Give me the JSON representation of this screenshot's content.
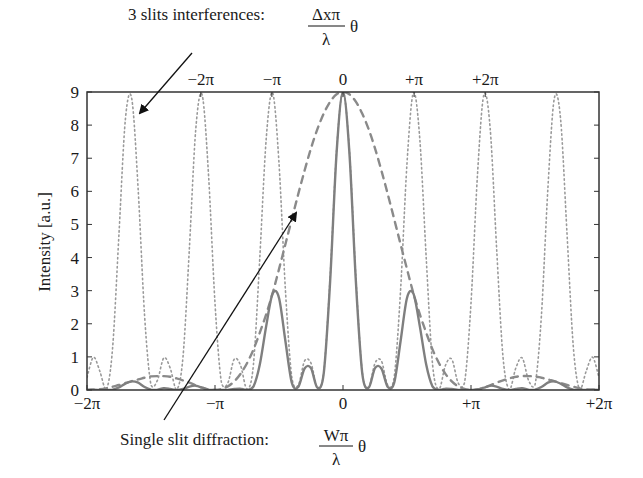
{
  "chart_data": {
    "type": "line",
    "title": "",
    "xlabel": "",
    "ylabel": "Intensity [a.u.]",
    "ylim": [
      0,
      9
    ],
    "xlim_pi": [
      -2,
      2
    ],
    "grid": false,
    "legend": "none",
    "y_ticks": [
      "0",
      "1",
      "2",
      "3",
      "4",
      "5",
      "6",
      "7",
      "8",
      "9"
    ],
    "x_ticks_bottom": [
      "−2π",
      "−π",
      "0",
      "+π",
      "+2π"
    ],
    "x_ticks_top": [
      "−2π",
      "−π",
      "0",
      "+π",
      "+2π"
    ],
    "bottom_axis_meaning": "Wπθ/λ (single slit phase)",
    "top_axis_meaning": "Δxπθ/λ (interference phase)",
    "top_to_bottom_scale_ratio": 1.8,
    "annotations": [
      {
        "text": "3 slits interferences:",
        "num": "Δxπ",
        "den": "λ",
        "suffix": "θ",
        "points_to": "dotted interference curve"
      },
      {
        "text": "Single slit diffraction:",
        "num": "Wπ",
        "den": "λ",
        "suffix": "θ",
        "points_to": "dashed envelope curve"
      }
    ],
    "x_half": [
      0,
      0.05,
      0.1,
      0.15,
      0.2,
      0.25,
      0.3,
      0.35,
      0.4,
      0.45,
      0.5,
      0.55,
      0.6,
      0.65,
      0.7,
      0.75,
      0.8,
      0.85,
      0.9,
      0.95,
      1.0,
      1.05,
      1.1,
      1.15,
      1.2,
      1.25,
      1.3,
      1.35,
      1.4,
      1.45,
      1.5,
      1.55,
      1.6,
      1.65,
      1.7,
      1.75,
      1.8,
      1.85,
      1.9,
      1.95,
      2.0
    ],
    "series": [
      {
        "name": "3 slits interferences",
        "style": "dotted",
        "color": "#9a9a9a",
        "symmetric": true,
        "values": [
          9,
          7.23,
          3.43,
          0.56,
          0.08,
          0.81,
          0.88,
          0.14,
          0.39,
          3.03,
          6.85,
          8.98,
          7.58,
          4,
          0.76,
          0.03,
          0.74,
          0.93,
          0.21,
          0.23,
          2.62,
          6.46,
          8.91,
          7.89,
          4.29,
          1,
          0.01,
          0.66,
          0.97,
          0.29,
          0.15,
          2.24,
          6.04,
          8.79,
          8.18,
          4.73,
          1.27,
          0,
          0.57,
          0.99,
          0.38
        ]
      },
      {
        "name": "Single slit diffraction",
        "style": "dashed",
        "color": "#8a8a8a",
        "symmetric": true,
        "values": [
          9,
          8.93,
          8.71,
          8.35,
          7.88,
          7.3,
          6.63,
          5.91,
          5.16,
          4.4,
          3.65,
          2.92,
          2.29,
          1.73,
          1.22,
          0.81,
          0.49,
          0.26,
          0.11,
          0.03,
          0,
          0.02,
          0.07,
          0.14,
          0.22,
          0.29,
          0.35,
          0.4,
          0.42,
          0.42,
          0.41,
          0.37,
          0.32,
          0.27,
          0.21,
          0.15,
          0.1,
          0.05,
          0.02,
          0.01,
          0
        ]
      },
      {
        "name": "Total intensity",
        "style": "solid",
        "color": "#7f7f7f",
        "symmetric": true,
        "values": [
          9,
          7.17,
          3.32,
          0.52,
          0.07,
          0.66,
          0.65,
          0.09,
          0.22,
          1.48,
          2.78,
          2.91,
          1.93,
          0.77,
          0.1,
          0,
          0.04,
          0.03,
          0,
          0,
          0,
          0.01,
          0.07,
          0.13,
          0.1,
          0.03,
          0,
          0.03,
          0.05,
          0.01,
          0.01,
          0.09,
          0.22,
          0.26,
          0.19,
          0.08,
          0.01,
          0,
          0,
          0.01,
          0
        ]
      }
    ]
  }
}
